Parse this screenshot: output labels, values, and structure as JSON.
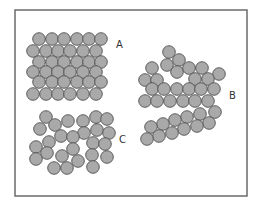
{
  "diagram": {
    "frame": {
      "x": 15,
      "y": 10,
      "width": 232,
      "height": 186,
      "stroke": "#6b6b6b"
    },
    "particle_style": {
      "radius": 6.3,
      "fill": "#a9a9a9",
      "stroke": "#505050"
    },
    "groups": [
      {
        "id": "A",
        "label": "A",
        "label_pos": [
          116,
          48
        ],
        "description": "regular close-packed lattice",
        "particles": [
          [
            39,
            39
          ],
          [
            52,
            39
          ],
          [
            64,
            39
          ],
          [
            77,
            39
          ],
          [
            89,
            39
          ],
          [
            101,
            39
          ],
          [
            33,
            51
          ],
          [
            46,
            51
          ],
          [
            58,
            51
          ],
          [
            70,
            51
          ],
          [
            83,
            51
          ],
          [
            96,
            51
          ],
          [
            39,
            62
          ],
          [
            52,
            62
          ],
          [
            64,
            62
          ],
          [
            77,
            62
          ],
          [
            89,
            62
          ],
          [
            101,
            62
          ],
          [
            33,
            72
          ],
          [
            46,
            72
          ],
          [
            58,
            72
          ],
          [
            70,
            72
          ],
          [
            83,
            72
          ],
          [
            96,
            72
          ],
          [
            39,
            82
          ],
          [
            52,
            82
          ],
          [
            64,
            82
          ],
          [
            77,
            82
          ],
          [
            89,
            82
          ],
          [
            101,
            82
          ],
          [
            33,
            94
          ],
          [
            46,
            94
          ],
          [
            58,
            94
          ],
          [
            70,
            94
          ],
          [
            83,
            94
          ],
          [
            96,
            94
          ]
        ]
      },
      {
        "id": "B",
        "label": "B",
        "label_pos": [
          229,
          99
        ],
        "description": "partially ordered clusters",
        "particles": [
          [
            169,
            52
          ],
          [
            179,
            60
          ],
          [
            167,
            65
          ],
          [
            177,
            72
          ],
          [
            189,
            68
          ],
          [
            202,
            68
          ],
          [
            219,
            74
          ],
          [
            152,
            68
          ],
          [
            145,
            80
          ],
          [
            157,
            80
          ],
          [
            195,
            79
          ],
          [
            208,
            79
          ],
          [
            152,
            89
          ],
          [
            164,
            89
          ],
          [
            177,
            89
          ],
          [
            189,
            89
          ],
          [
            201,
            89
          ],
          [
            214,
            89
          ],
          [
            145,
            101
          ],
          [
            157,
            101
          ],
          [
            170,
            101
          ],
          [
            183,
            101
          ],
          [
            195,
            101
          ],
          [
            208,
            101
          ],
          [
            215,
            112
          ],
          [
            200,
            114
          ],
          [
            187,
            117
          ],
          [
            175,
            120
          ],
          [
            163,
            124
          ],
          [
            151,
            127
          ],
          [
            209,
            123
          ],
          [
            197,
            126
          ],
          [
            184,
            129
          ],
          [
            172,
            133
          ],
          [
            159,
            136
          ],
          [
            147,
            139
          ]
        ]
      },
      {
        "id": "C",
        "label": "C",
        "label_pos": [
          119,
          143
        ],
        "description": "random disordered arrangement",
        "particles": [
          [
            46,
            117
          ],
          [
            68,
            121
          ],
          [
            55,
            125
          ],
          [
            40,
            129
          ],
          [
            83,
            121
          ],
          [
            96,
            117
          ],
          [
            107,
            119
          ],
          [
            97,
            130
          ],
          [
            109,
            133
          ],
          [
            84,
            133
          ],
          [
            61,
            136
          ],
          [
            73,
            137
          ],
          [
            49,
            142
          ],
          [
            36,
            147
          ],
          [
            93,
            143
          ],
          [
            105,
            144
          ],
          [
            73,
            149
          ],
          [
            47,
            153
          ],
          [
            62,
            156
          ],
          [
            36,
            159
          ],
          [
            78,
            161
          ],
          [
            92,
            155
          ],
          [
            107,
            157
          ],
          [
            54,
            168
          ],
          [
            67,
            168
          ],
          [
            93,
            167
          ]
        ]
      }
    ]
  }
}
